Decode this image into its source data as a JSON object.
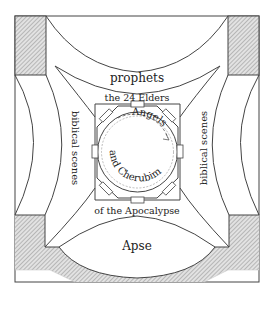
{
  "diagram": {
    "type": "architectural ceiling plan (church vault / dome program)",
    "labels": {
      "prophets": "prophets",
      "elders_top": "the 24 Elders",
      "angels": "Angels",
      "cherubim": "and Cherubim",
      "elders_bottom": "of the Apocalypse",
      "biblical_left": "biblical scenes",
      "biblical_right": "biblical scenes",
      "apse": "Apse"
    },
    "colors": {
      "line": "#444444",
      "hatch": "#9a9a9a",
      "background": "#ffffff",
      "text": "#222222"
    }
  }
}
